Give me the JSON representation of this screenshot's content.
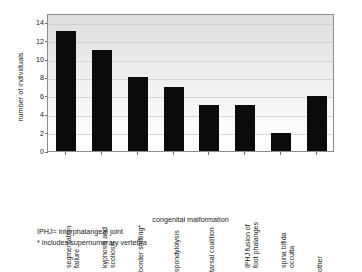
{
  "chart_data": {
    "type": "bar",
    "title": "",
    "xlabel": "congenital malformation",
    "ylabel": "number of individuals",
    "categories": [
      "segmentation failure",
      "kyphosis and scoliosis",
      "border shifting*",
      "spondylolysis",
      "tarsal coalition",
      "IPHJ fusion of foot phalanges",
      "spina bifida occulta",
      "other"
    ],
    "category_lines": [
      [
        "segmentation",
        "failure"
      ],
      [
        "kyphosis and",
        "scoliosis"
      ],
      [
        "border shifting*"
      ],
      [
        "spondylolysis"
      ],
      [
        "tarsal coalition"
      ],
      [
        "IPHJ fusion of",
        "foot phalanges"
      ],
      [
        "spina bifida",
        "occulta"
      ],
      [
        "other"
      ]
    ],
    "values": [
      13,
      11,
      8,
      7,
      5,
      5,
      2,
      6
    ],
    "ylim": [
      0,
      15
    ],
    "yticks": [
      0,
      2,
      4,
      6,
      8,
      10,
      12,
      14
    ],
    "ytick_labels": [
      "0",
      "2",
      "4",
      "6",
      "8",
      "10",
      "12",
      "14"
    ],
    "grid": true,
    "grid_axis": "y",
    "legend": "none",
    "bar_color": "#0b0b0b",
    "plot_background": "#e4e4e4",
    "frame_color": "#8c8c8c"
  },
  "footnotes": [
    "IPHJ= interphalangeal joint",
    "* includes supernumerary vertebra"
  ]
}
